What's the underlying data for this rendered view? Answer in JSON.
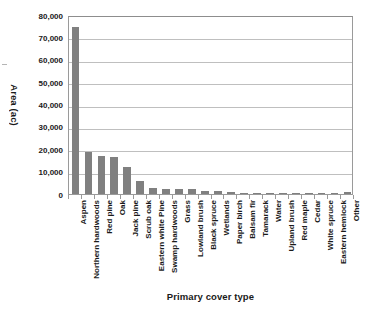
{
  "chart_data": {
    "type": "bar",
    "title": "",
    "xlabel": "Primary cover type",
    "ylabel": "Area (ac)",
    "ylim": [
      0,
      80000
    ],
    "ytick_labels": [
      "80,000",
      "70,000",
      "60,000",
      "50,000",
      "40,000",
      "30,000",
      "20,000",
      "10,000",
      "0"
    ],
    "ytick_values": [
      80000,
      70000,
      60000,
      50000,
      40000,
      30000,
      20000,
      10000,
      0
    ],
    "grid": true,
    "legend": "none",
    "bar_color": "#808080",
    "categories": [
      "Aspen",
      "Northern hardwoods",
      "Red pine",
      "Oak",
      "Jack pine",
      "Scrub oak",
      "Eastern white Pine",
      "Swamp hardwoods",
      "Grass",
      "Lowland brush",
      "Black spruce",
      "Wetlands",
      "Paper birch",
      "Balsam fir",
      "Tamarack",
      "Water",
      "Upland brush",
      "Red maple",
      "Cedar",
      "White spruce",
      "Eastern hemlock",
      "Other"
    ],
    "values": [
      74500,
      19000,
      17000,
      16500,
      12000,
      5800,
      2600,
      2400,
      2300,
      2200,
      1500,
      1300,
      900,
      600,
      450,
      400,
      300,
      250,
      200,
      150,
      120,
      1100
    ]
  }
}
